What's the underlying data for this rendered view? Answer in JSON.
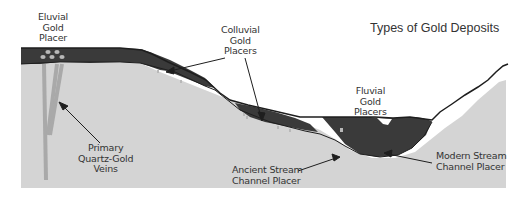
{
  "title": "Types of Gold Deposits",
  "labels": {
    "eluvial": [
      "Eluvial",
      "Gold",
      "Placer"
    ],
    "colluvial": [
      "Colluvial",
      "Gold",
      "Placers"
    ],
    "fluvial": [
      "Fluvial",
      "Gold",
      "Placers"
    ],
    "primary": [
      "Primary",
      "Quartz-Gold",
      "Veins"
    ],
    "ancient": [
      "Ancient Stream",
      "Channel Placer"
    ],
    "modern": [
      "Modern Stream",
      "Channel Placer"
    ]
  },
  "colors": {
    "bedrock": "#d4d4d4",
    "placer_sediment": "#3a3a3a",
    "veins": "#a9a9a9",
    "gold_nuggets": "#b8b8b8",
    "outline": "#1e1e1e",
    "text": "#333333"
  }
}
